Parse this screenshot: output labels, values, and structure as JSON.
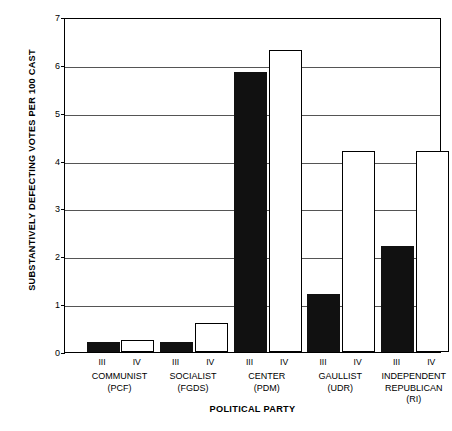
{
  "chart_data": {
    "type": "bar",
    "title": "",
    "xlabel": "POLITICAL PARTY",
    "ylabel": "SUBSTANTIVELY DEFECTING VOTES PER 100 CAST",
    "ylim": [
      0,
      7
    ],
    "yticks": [
      0,
      1,
      2,
      3,
      4,
      5,
      6,
      7
    ],
    "ytick_labels": [
      "0",
      "1",
      "2",
      "3",
      "4",
      "5",
      "6",
      "7"
    ],
    "grid": true,
    "legend_position": "none",
    "categories": [
      "COMMUNIST (PCF)",
      "SOCIALIST (FGDS)",
      "CENTER (PDM)",
      "GAULLIST (UDR)",
      "INDEPENDENT REPUBLICAN (RI)"
    ],
    "category_names": [
      "COMMUNIST",
      "SOCIALIST",
      "CENTER",
      "GAULLIST",
      "INDEPENDENT REPUBLICAN"
    ],
    "category_abbr": [
      "(PCF)",
      "(FGDS)",
      "(PDM)",
      "(UDR)",
      "(RI)"
    ],
    "subcategories": [
      "III",
      "IV"
    ],
    "series": [
      {
        "name": "III",
        "fill": "solid",
        "values": [
          0.2,
          0.2,
          5.85,
          1.22,
          2.22
        ]
      },
      {
        "name": "IV",
        "fill": "hollow",
        "values": [
          0.25,
          0.6,
          6.32,
          4.2,
          4.2
        ]
      }
    ],
    "colors": {
      "solid": "#111111",
      "hollow": "#ffffff",
      "outline": "#000000",
      "grid": "#555555"
    }
  },
  "groups": [
    {
      "name": "COMMUNIST",
      "abbr": "(PCF)",
      "bars": [
        {
          "label": "III",
          "value": 0.2,
          "fill": "solid",
          "centerPct": 10.1
        },
        {
          "label": "IV",
          "value": 0.25,
          "fill": "hollow",
          "centerPct": 19.3
        }
      ]
    },
    {
      "name": "SOCIALIST",
      "abbr": "(FGDS)",
      "bars": [
        {
          "label": "III",
          "value": 0.2,
          "fill": "solid",
          "centerPct": 29.6
        },
        {
          "label": "IV",
          "value": 0.6,
          "fill": "hollow",
          "centerPct": 38.8
        }
      ]
    },
    {
      "name": "CENTER",
      "abbr": "(PDM)",
      "bars": [
        {
          "label": "III",
          "value": 5.85,
          "fill": "solid",
          "centerPct": 49.2
        },
        {
          "label": "IV",
          "value": 6.32,
          "fill": "hollow",
          "centerPct": 58.4
        }
      ]
    },
    {
      "name": "GAULLIST",
      "abbr": "(UDR)",
      "bars": [
        {
          "label": "III",
          "value": 1.22,
          "fill": "solid",
          "centerPct": 68.7
        },
        {
          "label": "IV",
          "value": 4.2,
          "fill": "hollow",
          "centerPct": 77.9
        }
      ]
    },
    {
      "name": "INDEPENDENT REPUBLICAN",
      "abbr": "(RI)",
      "bars": [
        {
          "label": "III",
          "value": 2.22,
          "fill": "solid",
          "centerPct": 88.2
        },
        {
          "label": "IV",
          "value": 4.2,
          "fill": "hollow",
          "centerPct": 97.4
        }
      ]
    }
  ]
}
